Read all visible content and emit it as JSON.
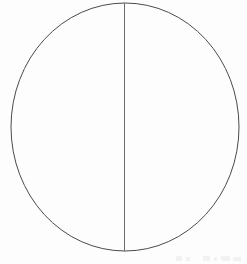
{
  "figure": {
    "title": "Circle divided by a vertical diameter",
    "background_color": "#fdfdfd",
    "canvas": {
      "width": 247,
      "height": 264
    },
    "shapes": [
      {
        "name": "circle-outline",
        "kind": "ellipse",
        "cx": 125,
        "cy": 127,
        "rx": 114,
        "ry": 124,
        "stroke_color": "#4a4a4a",
        "stroke_width": 1,
        "fill": "none"
      },
      {
        "name": "vertical-diameter",
        "kind": "line",
        "x1": 124.5,
        "y1": 3,
        "x2": 124.5,
        "y2": 251,
        "stroke_color": "#6a6a6a",
        "stroke_width": 1
      }
    ],
    "regions": [
      {
        "name": "left-half",
        "label": ""
      },
      {
        "name": "right-half",
        "label": ""
      }
    ],
    "artifacts": [
      {
        "name": "bottom-edge-scan-noise",
        "x": 176,
        "y": 256,
        "width": 6,
        "height": 5
      },
      {
        "name": "bottom-edge-scan-noise",
        "x": 186,
        "y": 257,
        "width": 4,
        "height": 4
      },
      {
        "name": "bottom-edge-scan-noise",
        "x": 203,
        "y": 256,
        "width": 7,
        "height": 5
      },
      {
        "name": "bottom-edge-scan-noise",
        "x": 214,
        "y": 257,
        "width": 3,
        "height": 4
      },
      {
        "name": "bottom-edge-scan-noise",
        "x": 221,
        "y": 256,
        "width": 9,
        "height": 5
      },
      {
        "name": "bottom-edge-scan-noise",
        "x": 233,
        "y": 257,
        "width": 8,
        "height": 4
      }
    ]
  }
}
